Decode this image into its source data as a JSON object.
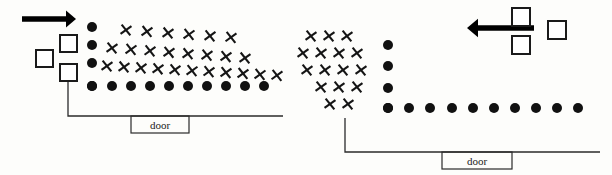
{
  "figure": {
    "title": "",
    "width": 612,
    "height": 175,
    "background_color": "#fdfdfb",
    "ink_color": "#111111"
  },
  "panels": [
    {
      "id": "left-panel",
      "name": "left-room-diagram",
      "door_label": "door",
      "flow_direction": "rightward",
      "wall": {
        "vertical_x": 68,
        "vertical_top_y": 82,
        "vertical_bottom_y": 116,
        "horizontal_y": 116,
        "horizontal_x1": 68,
        "horizontal_x2": 283
      },
      "door_box": {
        "x": 131,
        "y": 116,
        "width": 58,
        "height": 17
      },
      "arrow": {
        "name": "inflow-arrow",
        "direction": "right",
        "x1": 22,
        "x2": 76,
        "y": 19,
        "head_size": 10
      },
      "squares": [
        {
          "x": 60,
          "y": 35,
          "size": 17
        },
        {
          "x": 36,
          "y": 50,
          "size": 17
        },
        {
          "x": 60,
          "y": 64,
          "size": 17
        }
      ],
      "dot_radius": 5.0,
      "dots_vertical": [
        {
          "x": 92,
          "y": 27
        },
        {
          "x": 92,
          "y": 45
        },
        {
          "x": 92,
          "y": 63
        },
        {
          "x": 92,
          "y": 86
        }
      ],
      "dots_horizontal": [
        {
          "x": 92,
          "y": 86
        },
        {
          "x": 112,
          "y": 86
        },
        {
          "x": 131,
          "y": 86
        },
        {
          "x": 150,
          "y": 86
        },
        {
          "x": 169,
          "y": 86
        },
        {
          "x": 188,
          "y": 86
        },
        {
          "x": 207,
          "y": 86
        },
        {
          "x": 226,
          "y": 86
        },
        {
          "x": 245,
          "y": 86
        },
        {
          "x": 264,
          "y": 86
        }
      ],
      "x_mark_size": 7.0,
      "x_rows": [
        {
          "y": 30,
          "slope": 0.07,
          "x_start": 126,
          "spacing": 21,
          "count": 6
        },
        {
          "y": 48,
          "slope": 0.075,
          "x_start": 112,
          "spacing": 19,
          "count": 8
        },
        {
          "y": 66,
          "slope": 0.055,
          "x_start": 107,
          "spacing": 17,
          "count": 11
        }
      ]
    },
    {
      "id": "right-panel",
      "name": "right-room-diagram",
      "door_label": "door",
      "flow_direction": "leftward",
      "wall": {
        "vertical_x": 345,
        "vertical_top_y": 118,
        "vertical_bottom_y": 152,
        "horizontal_y": 152,
        "horizontal_x1": 345,
        "horizontal_x2": 600
      },
      "door_box": {
        "x": 442,
        "y": 152,
        "width": 70,
        "height": 17
      },
      "arrow": {
        "name": "outflow-arrow",
        "direction": "left",
        "x1": 534,
        "x2": 467,
        "y": 28,
        "head_size": 11
      },
      "squares": [
        {
          "x": 512,
          "y": 8,
          "size": 18
        },
        {
          "x": 548,
          "y": 21,
          "size": 18
        },
        {
          "x": 512,
          "y": 36,
          "size": 18
        }
      ],
      "dot_radius": 5.0,
      "dots_vertical": [
        {
          "x": 388,
          "y": 45
        },
        {
          "x": 388,
          "y": 66
        },
        {
          "x": 388,
          "y": 88
        },
        {
          "x": 388,
          "y": 108
        }
      ],
      "dots_horizontal": [
        {
          "x": 388,
          "y": 108
        },
        {
          "x": 409,
          "y": 108
        },
        {
          "x": 430,
          "y": 108
        },
        {
          "x": 452,
          "y": 108
        },
        {
          "x": 473,
          "y": 108
        },
        {
          "x": 494,
          "y": 108
        },
        {
          "x": 515,
          "y": 108
        },
        {
          "x": 536,
          "y": 108
        },
        {
          "x": 557,
          "y": 108
        },
        {
          "x": 578,
          "y": 108
        }
      ],
      "x_mark_size": 7.0,
      "x_rows": [
        {
          "y": 36,
          "slope": 0.0,
          "x_start": 311,
          "spacing": 18,
          "count": 3,
          "x_offset": 0
        },
        {
          "y": 53,
          "slope": 0.0,
          "x_start": 303,
          "spacing": 18,
          "count": 4,
          "x_offset": 0
        },
        {
          "y": 70,
          "slope": 0.0,
          "x_start": 307,
          "spacing": 18,
          "count": 4,
          "x_offset": 0
        },
        {
          "y": 87,
          "slope": 0.0,
          "x_start": 321,
          "spacing": 18,
          "count": 3,
          "x_offset": 0
        },
        {
          "y": 104,
          "slope": 0.0,
          "x_start": 330,
          "spacing": 18,
          "count": 2,
          "x_offset": 0
        }
      ]
    }
  ],
  "legend": {
    "dot_meaning": "",
    "x_meaning": "",
    "square_meaning": ""
  }
}
